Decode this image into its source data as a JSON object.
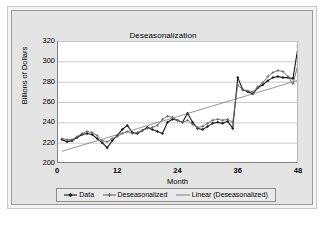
{
  "chart_data": {
    "type": "line",
    "title": "Deseasonalization",
    "xlabel": "Month",
    "ylabel": "Billions of Dollars",
    "xlim": [
      0,
      48
    ],
    "ylim": [
      200,
      320
    ],
    "xticks": [
      0,
      12,
      24,
      36,
      48
    ],
    "yticks": [
      200,
      220,
      240,
      260,
      280,
      300,
      320
    ],
    "grid": "horizontal",
    "legend_position": "bottom",
    "x": [
      1,
      2,
      3,
      4,
      5,
      6,
      7,
      8,
      9,
      10,
      11,
      12,
      13,
      14,
      15,
      16,
      17,
      18,
      19,
      20,
      21,
      22,
      23,
      24,
      25,
      26,
      27,
      28,
      29,
      30,
      31,
      32,
      33,
      34,
      35,
      36,
      37,
      38,
      39,
      40,
      41,
      42,
      43,
      44,
      45,
      46,
      47,
      48
    ],
    "series": [
      {
        "name": "Data",
        "marker": "diamond",
        "color": "#1a1a1a",
        "values": [
          223,
          221,
          222,
          225,
          228,
          229,
          228,
          224,
          220,
          215,
          222,
          227,
          233,
          237,
          230,
          229,
          232,
          235,
          233,
          231,
          229,
          240,
          243,
          242,
          240,
          249,
          240,
          234,
          233,
          236,
          239,
          240,
          239,
          241,
          234,
          284,
          272,
          270,
          268,
          274,
          277,
          281,
          284,
          285,
          284,
          284,
          283,
          314
        ]
      },
      {
        "name": "Deseasonalized",
        "marker": "cross",
        "color": "#6b6b6b",
        "values": [
          224,
          223,
          223,
          226,
          229,
          231,
          230,
          227,
          222,
          221,
          224,
          226,
          229,
          231,
          229,
          230,
          232,
          234,
          235,
          237,
          243,
          246,
          245,
          242,
          240,
          242,
          238,
          235,
          236,
          239,
          242,
          243,
          242,
          243,
          240,
          277,
          272,
          271,
          270,
          275,
          279,
          285,
          289,
          291,
          290,
          285,
          278,
          297
        ]
      },
      {
        "name": "Linear (Deseasonalized)",
        "marker": "none",
        "color": "#777777",
        "trend": true,
        "values": [
          211.5,
          213.0,
          214.5,
          216.0,
          217.5,
          219.0,
          220.4,
          221.9,
          223.4,
          224.9,
          226.4,
          227.9,
          229.4,
          230.8,
          232.3,
          233.8,
          235.3,
          236.8,
          238.3,
          239.8,
          241.2,
          242.7,
          244.2,
          245.7,
          247.2,
          248.7,
          250.2,
          251.6,
          253.1,
          254.6,
          256.1,
          257.6,
          259.1,
          260.6,
          262.0,
          263.5,
          265.0,
          266.5,
          268.0,
          269.5,
          271.0,
          272.4,
          273.9,
          275.4,
          276.9,
          278.4,
          279.9,
          281.4
        ]
      }
    ]
  },
  "legend": {
    "items": [
      {
        "label": "Data",
        "marker": "diamond",
        "color": "#1a1a1a"
      },
      {
        "label": "Deseasonalized",
        "marker": "cross",
        "color": "#6b6b6b"
      },
      {
        "label": "Linear (Deseasonalized)",
        "marker": "none",
        "color": "#777777"
      }
    ]
  },
  "caption": ""
}
